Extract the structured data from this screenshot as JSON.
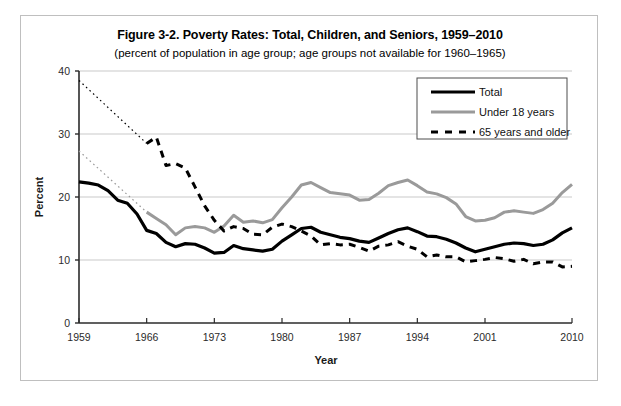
{
  "figure": {
    "title": "Figure 3-2. Poverty Rates: Total, Children, and Seniors, 1959–2010",
    "subtitle": "(percent of population in age group; age groups not available for 1960–1965)"
  },
  "chart_data": {
    "type": "line",
    "title": "Figure 3-2. Poverty Rates: Total, Children, and Seniors, 1959–2010",
    "subtitle": "(percent of population in age group; age groups not available for 1960–1965)",
    "xlabel": "Year",
    "ylabel": "Percent",
    "xlim": [
      1959,
      2010
    ],
    "ylim": [
      0,
      40
    ],
    "ytick_values": [
      0,
      10,
      20,
      30,
      40
    ],
    "ytick_labels": [
      "0",
      "10",
      "20",
      "30",
      "40"
    ],
    "xtick_values": [
      1959,
      1966,
      1973,
      1980,
      1987,
      1994,
      2001,
      2010
    ],
    "xtick_labels": [
      "1959",
      "1966",
      "1973",
      "1980",
      "1987",
      "1994",
      "2001",
      "2010"
    ],
    "grid": "horizontal",
    "legend_position": "top-right",
    "x": [
      1959,
      1960,
      1961,
      1962,
      1963,
      1964,
      1965,
      1966,
      1967,
      1968,
      1969,
      1970,
      1971,
      1972,
      1973,
      1974,
      1975,
      1976,
      1977,
      1978,
      1979,
      1980,
      1981,
      1982,
      1983,
      1984,
      1985,
      1986,
      1987,
      1988,
      1989,
      1990,
      1991,
      1992,
      1993,
      1994,
      1995,
      1996,
      1997,
      1998,
      1999,
      2000,
      2001,
      2002,
      2003,
      2004,
      2005,
      2006,
      2007,
      2008,
      2009,
      2010
    ],
    "series": [
      {
        "name": "Total",
        "color": "#000000",
        "style": "solid",
        "width": 3.2,
        "values": [
          22.4,
          22.2,
          21.9,
          21.0,
          19.5,
          19.0,
          17.3,
          14.7,
          14.2,
          12.8,
          12.1,
          12.6,
          12.5,
          11.9,
          11.1,
          11.2,
          12.3,
          11.8,
          11.6,
          11.4,
          11.7,
          13.0,
          14.0,
          15.0,
          15.2,
          14.4,
          14.0,
          13.6,
          13.4,
          13.0,
          12.8,
          13.5,
          14.2,
          14.8,
          15.1,
          14.5,
          13.8,
          13.7,
          13.3,
          12.7,
          11.9,
          11.3,
          11.7,
          12.1,
          12.5,
          12.7,
          12.6,
          12.3,
          12.5,
          13.2,
          14.3,
          15.1
        ]
      },
      {
        "name": "Under 18 years",
        "color": "#9a9a9a",
        "style": "solid",
        "width": 3.0,
        "values": [
          27.3,
          null,
          null,
          null,
          null,
          null,
          null,
          17.6,
          16.6,
          15.6,
          14.0,
          15.1,
          15.3,
          15.1,
          14.4,
          15.4,
          17.1,
          16.0,
          16.2,
          15.9,
          16.4,
          18.3,
          20.0,
          21.9,
          22.3,
          21.5,
          20.7,
          20.5,
          20.3,
          19.5,
          19.6,
          20.6,
          21.8,
          22.3,
          22.7,
          21.8,
          20.8,
          20.5,
          19.9,
          18.9,
          16.9,
          16.2,
          16.3,
          16.7,
          17.6,
          17.8,
          17.6,
          17.4,
          18.0,
          19.0,
          20.7,
          22.0
        ]
      },
      {
        "name": "65 years and older",
        "color": "#000000",
        "style": "dashed",
        "width": 3.0,
        "values": [
          38.5,
          null,
          null,
          null,
          null,
          null,
          null,
          28.5,
          29.5,
          25.0,
          25.3,
          24.6,
          21.6,
          18.6,
          16.3,
          14.6,
          15.3,
          15.0,
          14.1,
          14.0,
          15.2,
          15.7,
          15.3,
          14.6,
          13.8,
          12.4,
          12.6,
          12.4,
          12.5,
          12.0,
          11.4,
          12.2,
          12.4,
          12.9,
          12.2,
          11.7,
          10.5,
          10.8,
          10.5,
          10.5,
          9.7,
          9.9,
          10.1,
          10.4,
          10.2,
          9.8,
          10.1,
          9.4,
          9.7,
          9.7,
          8.9,
          9.0
        ]
      }
    ],
    "interpolated_segments": [
      {
        "series": "Under 18 years",
        "note": "dotted interpolation 1959-1966 (data not available 1960-1965)",
        "from": {
          "x": 1959,
          "y": 27.3
        },
        "to": {
          "x": 1966,
          "y": 17.6
        }
      },
      {
        "series": "65 years and older",
        "note": "dotted interpolation 1959-1966 (data not available 1960-1965)",
        "from": {
          "x": 1959,
          "y": 38.5
        },
        "to": {
          "x": 1966,
          "y": 28.5
        }
      }
    ]
  },
  "legend": {
    "items": [
      {
        "label": "Total",
        "swatch": "solid-thick-black"
      },
      {
        "label": "Under 18 years",
        "swatch": "solid-gray"
      },
      {
        "label": "65 years and older",
        "swatch": "dashed-black"
      }
    ]
  }
}
